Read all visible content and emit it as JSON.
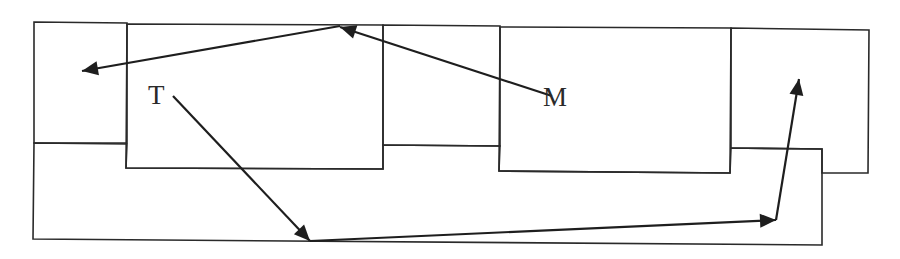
{
  "diagram": {
    "labels": {
      "t": {
        "text": "T",
        "x": 148,
        "y": 104
      },
      "m": {
        "text": "M",
        "x": 543,
        "y": 106
      }
    },
    "regions": [
      {
        "name": "left-cell",
        "points": "34,22 127,23 127,143 34,143"
      },
      {
        "name": "box-t",
        "points": "127,24 383,25 383,169 126,168"
      },
      {
        "name": "middle-cell",
        "points": "383,25 500,26 500,146 383,145"
      },
      {
        "name": "box-m",
        "points": "500,27 731,28 730,173 499,171"
      },
      {
        "name": "right-cell",
        "points": "731,28 869,30 868,173 822,173 822,149 731,148"
      },
      {
        "name": "bottom-band",
        "points": "34,143 127,144 126,168 383,169 383,145 500,146 499,171 730,173 731,148 822,149 822,245 33,239"
      }
    ],
    "arrows": [
      {
        "name": "arrow-m-to-top",
        "from": [
          552,
          96
        ],
        "to": [
          340,
          27
        ]
      },
      {
        "name": "arrow-top-to-left",
        "from": [
          340,
          26
        ],
        "to": [
          82,
          71
        ]
      },
      {
        "name": "arrow-t-to-bottom",
        "from": [
          173,
          96
        ],
        "to": [
          310,
          241
        ]
      },
      {
        "name": "arrow-bottom-to-right",
        "from": [
          310,
          241
        ],
        "to": [
          776,
          220
        ]
      },
      {
        "name": "arrow-right-up",
        "from": [
          776,
          220
        ],
        "to": [
          799,
          79
        ]
      }
    ],
    "colors": {
      "stroke": "#2a2a2a",
      "background": "#ffffff"
    }
  }
}
